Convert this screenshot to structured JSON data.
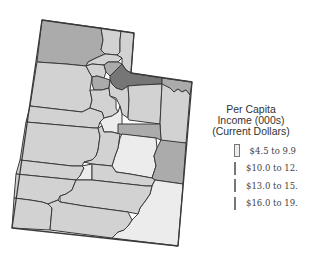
{
  "legend": {
    "title_lines": [
      "Per Capita",
      "Income (000s)",
      "(Current Dollars)"
    ],
    "items": [
      {
        "label": "$4.5 to 9.9",
        "color": "#ececec"
      },
      {
        "label": "$10.0 to 12.9",
        "color": "#d2d2d2"
      },
      {
        "label": "$13.0 to 15.9",
        "color": "#ababab"
      },
      {
        "label": "$16.0 to 19.9",
        "color": "#767676"
      }
    ]
  },
  "colors": {
    "class1": "#ececec",
    "class2": "#d2d2d2",
    "class3": "#ababab",
    "class4": "#767676",
    "border": "#3a3a3a"
  }
}
